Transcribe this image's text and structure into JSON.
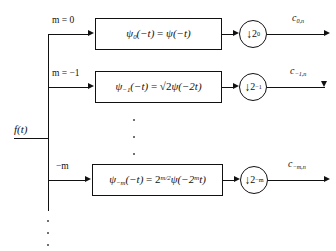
{
  "figure": {
    "type": "block-diagram",
    "input": {
      "label": "f(t)"
    },
    "branches": [
      {
        "scale_label": "m = 0",
        "filter": "ψ₀(−t) = ψ(−t)",
        "filter_parts": {
          "lhs_symbol": "ψ",
          "lhs_sub": "0",
          "lhs_arg": "(−t)",
          "eq": "=",
          "rhs_coeff": "",
          "rhs_symbol": "ψ",
          "rhs_arg": "(−t)"
        },
        "downsampler": {
          "arrow": "↓",
          "factor_base": "2",
          "factor_exp": "0"
        },
        "output": {
          "symbol": "c",
          "sub": "0,n"
        }
      },
      {
        "scale_label": "m = −1",
        "filter": "ψ₋₁(−t) = √2ψ(−2t)",
        "filter_parts": {
          "lhs_symbol": "ψ",
          "lhs_sub": "−1",
          "lhs_arg": "(−t)",
          "eq": "=",
          "rhs_coeff": "√2",
          "rhs_symbol": "ψ",
          "rhs_arg": "(−2t)"
        },
        "downsampler": {
          "arrow": "↓",
          "factor_base": "2",
          "factor_exp": "−1"
        },
        "output": {
          "symbol": "c",
          "sub": "−1,n"
        }
      },
      {
        "scale_label": "−m",
        "filter": "ψ₋ₘ(−t) = 2^(m/2)ψ(−2^m t)",
        "filter_parts": {
          "lhs_symbol": "ψ",
          "lhs_sub": "−m",
          "lhs_arg": "(−t)",
          "eq": "=",
          "rhs_coeff": "2",
          "rhs_coeff_exp": "m/2",
          "rhs_symbol": "ψ",
          "rhs_arg_open": "(−2",
          "rhs_arg_exp": "m",
          "rhs_arg_close": "t)"
        },
        "downsampler": {
          "arrow": "↓",
          "factor_base": "2",
          "factor_exp": "−m"
        },
        "output": {
          "symbol": "c",
          "sub": "−m,n"
        }
      }
    ],
    "ellipsis": {
      "middle": "⋮",
      "bottom": "⋮"
    },
    "colors": {
      "line": "#111111",
      "background": "#ffffff",
      "dot": "#555555"
    }
  }
}
